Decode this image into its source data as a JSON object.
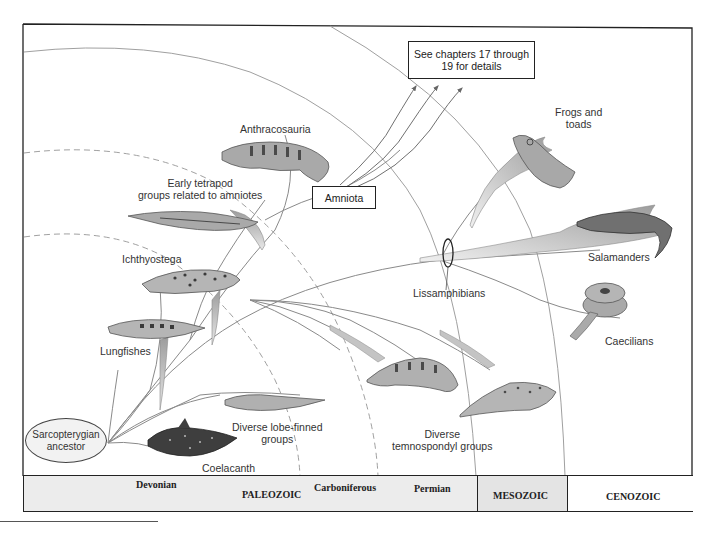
{
  "figure": {
    "root": {
      "label_line1": "Sarcopterygian",
      "label_line2": "ancestor"
    },
    "callout_box": {
      "line1": "See chapters 17 through",
      "line2": "19 for details"
    },
    "amniota_box": "Amniota",
    "clade_marker": "Lissamphibians",
    "taxa": [
      {
        "id": "anthracosauria",
        "label": "Anthracosauria"
      },
      {
        "id": "early-tetrapods",
        "label_line1": "Early tetrapod",
        "label_line2": "groups related to amniotes"
      },
      {
        "id": "ichthyostega",
        "label": "Ichthyostega"
      },
      {
        "id": "lungfishes",
        "label": "Lungfishes"
      },
      {
        "id": "lobe-finned",
        "label_line1": "Diverse lobe-finned",
        "label_line2": "groups"
      },
      {
        "id": "coelacanth",
        "label": "Coelacanth"
      },
      {
        "id": "temnospondyls",
        "label_line1": "Diverse",
        "label_line2": "temnospondyl groups"
      },
      {
        "id": "frogs",
        "label_line1": "Frogs and",
        "label_line2": "toads"
      },
      {
        "id": "salamanders",
        "label": "Salamanders"
      },
      {
        "id": "caecilians",
        "label": "Caecilians"
      }
    ]
  },
  "timeline": {
    "periods": [
      "Devonian",
      "Carboniferous",
      "Permian"
    ],
    "eras": [
      "PALEOZOIC",
      "MESOZOIC",
      "CENOZOIC"
    ]
  },
  "colors": {
    "frame": "#222222",
    "boundary_line": "#9a9a9a",
    "branch": "#8a8a8a",
    "branch_fill": "#b9b9b9",
    "animal_body": "#a9a9a9",
    "animal_spots": "#4a4a4a",
    "timeline_bg": "#ececec",
    "mesozoic_bg": "#e4e4e4",
    "cenozoic_bg": "#ffffff"
  }
}
